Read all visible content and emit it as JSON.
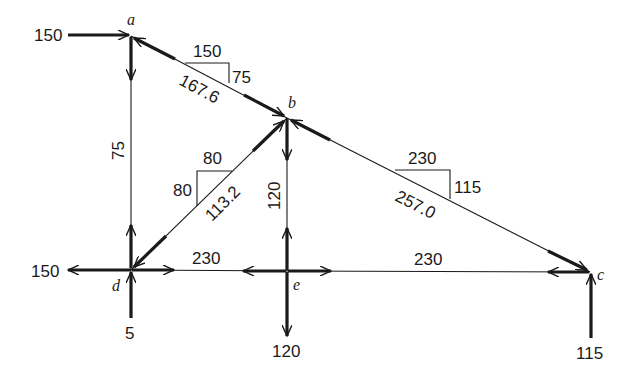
{
  "nodes": {
    "a": {
      "label": "a",
      "x": 131,
      "y": 36
    },
    "b": {
      "label": "b",
      "x": 287,
      "y": 118
    },
    "c": {
      "label": "c",
      "x": 590,
      "y": 272
    },
    "d": {
      "label": "d",
      "x": 131,
      "y": 270
    },
    "e": {
      "label": "e",
      "x": 287,
      "y": 271
    }
  },
  "members": [
    {
      "id": "ab",
      "from": "a",
      "to": "b",
      "force": "167.6",
      "slope": {
        "run": "150",
        "rise": "75"
      }
    },
    {
      "id": "bc",
      "from": "b",
      "to": "c",
      "force": "257.0",
      "slope": {
        "run": "230",
        "rise": "115"
      }
    },
    {
      "id": "bd",
      "from": "b",
      "to": "d",
      "force": "113.2",
      "slope": {
        "run": "80",
        "rise": "80"
      }
    },
    {
      "id": "ad",
      "from": "a",
      "to": "d",
      "force": "75"
    },
    {
      "id": "be",
      "from": "b",
      "to": "e",
      "force": "120"
    },
    {
      "id": "de",
      "from": "d",
      "to": "e",
      "force": "230"
    },
    {
      "id": "ec",
      "from": "e",
      "to": "c",
      "force": "230"
    }
  ],
  "external_forces": [
    {
      "node": "a",
      "direction": "right",
      "value": "150"
    },
    {
      "node": "d",
      "direction": "left",
      "value": "150"
    },
    {
      "node": "d",
      "direction": "up",
      "value": "5"
    },
    {
      "node": "e",
      "direction": "down",
      "value": "120"
    },
    {
      "node": "c",
      "direction": "up",
      "value": "115"
    }
  ],
  "labels": {
    "a": "a",
    "b": "b",
    "c": "c",
    "d": "d",
    "e": "e",
    "f_ab": "167.6",
    "run_ab": "150",
    "rise_ab": "75",
    "f_bc": "257.0",
    "run_bc": "230",
    "rise_bc": "115",
    "f_bd": "113.2",
    "run_bd": "80",
    "rise_bd": "80",
    "f_ad": "75",
    "f_be": "120",
    "f_de": "230",
    "f_ec": "230",
    "ext_a": "150",
    "ext_d_h": "150",
    "ext_d_v": "5",
    "ext_e": "120",
    "ext_c": "115"
  }
}
